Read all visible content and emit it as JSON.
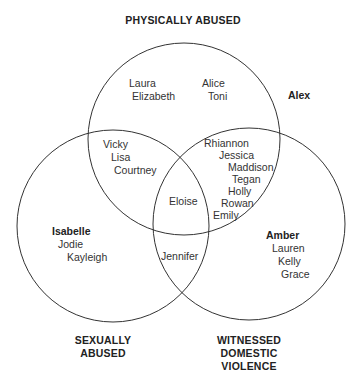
{
  "diagram": {
    "type": "venn",
    "sets": {
      "physical": "PHYSICALLY ABUSED",
      "sexual_1": "SEXUALLY",
      "sexual_2": "ABUSED",
      "dv_1": "WITNESSED",
      "dv_2": "DOMESTIC",
      "dv_3": "VIOLENCE"
    },
    "outside": [
      "Alex"
    ],
    "physical_only": [
      "Laura",
      "Elizabeth",
      "Alice",
      "Toni"
    ],
    "physical_sexual": [
      "Vicky",
      "Lisa",
      "Courtney"
    ],
    "physical_dv": [
      "Rhiannon",
      "Jessica",
      "Maddison",
      "Tegan",
      "Holly",
      "Rowan",
      "Emily"
    ],
    "all_three": [
      "Eloise"
    ],
    "sexual_dv": [
      "Jennifer"
    ],
    "sexual_only": [
      "Isabelle",
      "Jodie",
      "Kayleigh"
    ],
    "dv_only": [
      "Amber",
      "Lauren",
      "Kelly",
      "Grace"
    ],
    "stroke_color": "#333333"
  }
}
